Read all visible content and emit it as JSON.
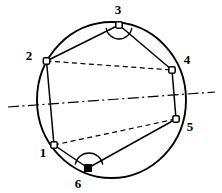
{
  "figure": {
    "background_color": "#ffffff",
    "stroke_color": "#000000",
    "width": 222,
    "height": 193
  },
  "circle": {
    "name": "circumscribed-circle",
    "center_x": 111.5,
    "center_y": 100.0,
    "radius_x": 74.5,
    "radius_y": 78.0,
    "stroke_width": 1.9,
    "style": "solid"
  },
  "vertices": [
    {
      "id": "1",
      "label": "1",
      "x": 54,
      "y": 145,
      "marker": "open-square",
      "label_x": 43,
      "label_y": 157,
      "has_angle_arc": false
    },
    {
      "id": "2",
      "label": "2",
      "x": 46.5,
      "y": 61,
      "marker": "open-square",
      "label_x": 29,
      "label_y": 60,
      "has_angle_arc": false
    },
    {
      "id": "3",
      "label": "3",
      "x": 119,
      "y": 25,
      "marker": "open-square",
      "label_x": 118,
      "label_y": 14,
      "has_angle_arc": true
    },
    {
      "id": "4",
      "label": "4",
      "x": 172,
      "y": 70,
      "marker": "open-square",
      "label_x": 187,
      "label_y": 64,
      "has_angle_arc": false
    },
    {
      "id": "5",
      "label": "5",
      "x": 176,
      "y": 119,
      "marker": "open-square",
      "label_x": 190,
      "label_y": 131,
      "has_angle_arc": false
    },
    {
      "id": "6",
      "label": "6",
      "x": 88,
      "y": 168,
      "marker": "filled-square",
      "label_x": 78,
      "label_y": 188,
      "has_angle_arc": true
    }
  ],
  "solid_chords": [
    {
      "name": "chord-2-3",
      "from": "2",
      "to": "3"
    },
    {
      "name": "chord-3-4",
      "from": "3",
      "to": "4"
    },
    {
      "name": "chord-4-5",
      "from": "4",
      "to": "5"
    },
    {
      "name": "chord-5-6",
      "from": "5",
      "to": "6"
    },
    {
      "name": "chord-6-1",
      "from": "6",
      "to": "1"
    },
    {
      "name": "chord-1-2",
      "from": "1",
      "to": "2"
    }
  ],
  "dashed_chords": [
    {
      "name": "dashed-chord-2-4",
      "from": "2",
      "to": "4"
    },
    {
      "name": "dashed-chord-1-5",
      "from": "1",
      "to": "5"
    }
  ],
  "axis_of_symmetry": {
    "name": "axis-of-symmetry",
    "x1": 8,
    "y1": 107,
    "x2": 215,
    "y2": 92,
    "style": "dash-dot",
    "stroke_width": 1.2
  },
  "angle_arcs": [
    {
      "name": "angle-arc-vertex-3",
      "vertex": "3",
      "center_x": 119,
      "center_y": 26,
      "radius": 13,
      "start_angle_deg": 8,
      "end_angle_deg": 172
    },
    {
      "name": "angle-arc-vertex-6",
      "vertex": "6",
      "center_x": 89,
      "center_y": 167,
      "radius": 14,
      "start_angle_deg": 190,
      "end_angle_deg": 350
    }
  ]
}
